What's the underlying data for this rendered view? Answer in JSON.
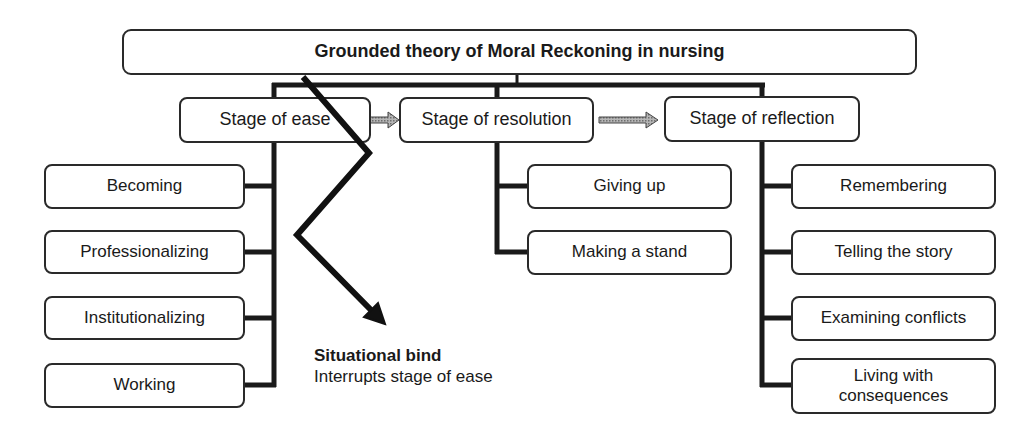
{
  "diagram": {
    "title": "Grounded theory of Moral Reckoning in nursing",
    "stages": [
      {
        "label": "Stage of ease",
        "subitems": [
          "Becoming",
          "Professionalizing",
          "Institutionalizing",
          "Working"
        ]
      },
      {
        "label": "Stage of resolution",
        "subitems": [
          "Giving up",
          "Making a stand"
        ]
      },
      {
        "label": "Stage of reflection",
        "subitems": [
          "Remembering",
          "Telling the story",
          "Examining conflicts",
          "Living with consequences"
        ]
      }
    ],
    "interruption": {
      "title": "Situational bind",
      "description": "Interrupts stage of ease"
    },
    "colors": {
      "line": "#1a1a1a",
      "box_border": "#2a2a2a",
      "progress_arrow_fill": "#9a9a9a"
    }
  }
}
